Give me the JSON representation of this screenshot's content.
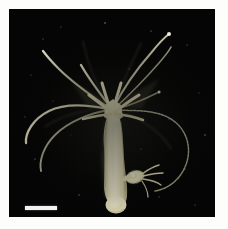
{
  "figure": {
    "kind": "photomicrograph",
    "subject": "Hydra polyp",
    "background_color": "#050505",
    "paper_color": "#fdfdfb",
    "tissue_color": "#e9e5bd",
    "tissue_highlight_color": "#f6f3d8",
    "tentacle_color": "#d8d5b4",
    "alt": "Photomicrograph of a Hydra polyp on a black background, with a crown of radiating tentacles, an elongated body column, a small bud on the right side, a basal foot, and a white scale bar at lower left."
  },
  "scale_bar": {
    "name": "scale-bar",
    "label": "",
    "color": "#f2f2ee",
    "length_px": 32,
    "thickness_px": 4,
    "position": "lower-left"
  },
  "anatomy": {
    "tentacle_crown": {
      "label": "tentacle crown",
      "tentacle_count": 7
    },
    "hypostome": {
      "label": "hypostome"
    },
    "body_column": {
      "label": "body column"
    },
    "bud": {
      "label": "bud",
      "side": "right",
      "tentacle_count": 4
    },
    "peduncle": {
      "label": "peduncle"
    },
    "basal_disc": {
      "label": "basal disc / foot"
    }
  },
  "specks": [
    {
      "x": 34,
      "y": 30,
      "r": 0.7
    },
    {
      "x": 52,
      "y": 18,
      "r": 0.6
    },
    {
      "x": 96,
      "y": 14,
      "r": 0.8
    },
    {
      "x": 142,
      "y": 22,
      "r": 0.6
    },
    {
      "x": 178,
      "y": 36,
      "r": 0.7
    },
    {
      "x": 190,
      "y": 84,
      "r": 0.6
    },
    {
      "x": 196,
      "y": 126,
      "r": 0.8
    },
    {
      "x": 176,
      "y": 160,
      "r": 0.6
    },
    {
      "x": 150,
      "y": 188,
      "r": 0.7
    },
    {
      "x": 112,
      "y": 196,
      "r": 0.6
    },
    {
      "x": 70,
      "y": 186,
      "r": 0.7
    },
    {
      "x": 26,
      "y": 150,
      "r": 0.6
    },
    {
      "x": 16,
      "y": 108,
      "r": 0.7
    },
    {
      "x": 22,
      "y": 66,
      "r": 0.6
    },
    {
      "x": 120,
      "y": 60,
      "r": 0.5
    },
    {
      "x": 160,
      "y": 110,
      "r": 0.5
    },
    {
      "x": 62,
      "y": 126,
      "r": 0.5
    },
    {
      "x": 186,
      "y": 196,
      "r": 0.6
    },
    {
      "x": 44,
      "y": 92,
      "r": 0.5
    },
    {
      "x": 132,
      "y": 140,
      "r": 0.5
    }
  ]
}
